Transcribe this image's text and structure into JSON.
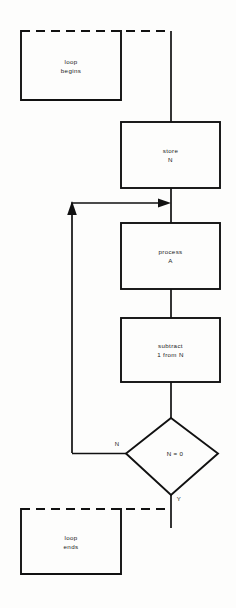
{
  "diagram": {
    "background_color": "#fdfdfc",
    "stroke_color": "#111111",
    "text_color": "#1a1a1a"
  },
  "nodes": {
    "loop_begins": {
      "line1": "loop",
      "line2": "begins",
      "shape": "open-top-dashed-box"
    },
    "store_n": {
      "line1": "store",
      "line2": "N",
      "shape": "rectangle"
    },
    "process_a": {
      "line1": "process",
      "line2": "A",
      "shape": "rectangle"
    },
    "subtract": {
      "line1": "subtract",
      "line2": "1 from N",
      "shape": "rectangle"
    },
    "decision": {
      "line1": "N = 0",
      "shape": "diamond"
    },
    "loop_ends": {
      "line1": "loop",
      "line2": "ends",
      "shape": "open-top-dashed-box"
    }
  },
  "branches": {
    "no_label": "N",
    "yes_label": "Y"
  }
}
